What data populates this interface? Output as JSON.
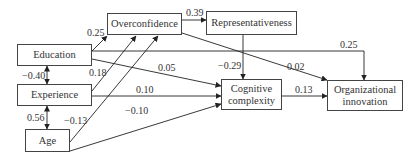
{
  "nodes": {
    "education": "Education",
    "experience": "Experience",
    "age": "Age",
    "overconfidence": "Overconfidence",
    "representativeness": "Representativeness",
    "cognitive_line1": "Cognitive",
    "cognitive_line2": "complexity",
    "org_line1": "Organizational",
    "org_line2": "innovation"
  },
  "paths": {
    "education_overconfidence": "0.25",
    "experience_overconfidence": "0.18",
    "age_overconfidence": "−0.13",
    "overconfidence_representativeness": "0.39",
    "representativeness_cognitive": "−0.29",
    "overconfidence_org": "0.02",
    "education_org": "0.25",
    "education_cognitive": "0.05",
    "experience_cognitive": "0.10",
    "age_cognitive": "−0.10",
    "cognitive_org": "0.13",
    "education_experience_cov": "−0.40",
    "experience_age_cov": "0.56"
  }
}
